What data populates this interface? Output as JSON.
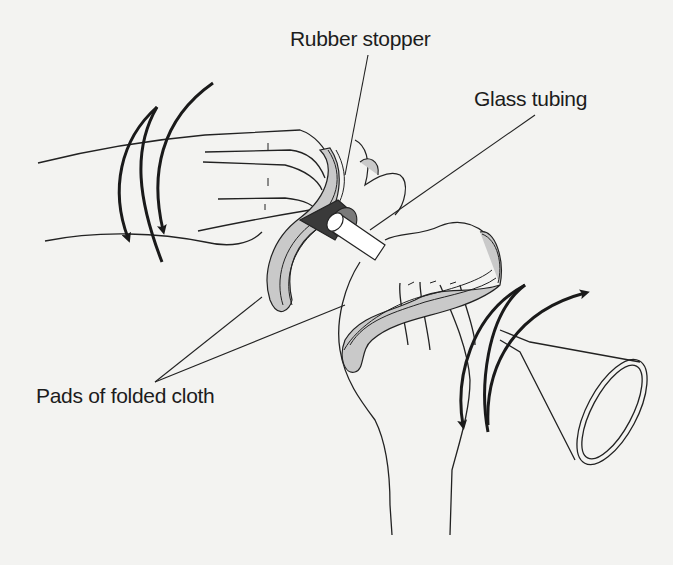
{
  "figure": {
    "type": "illustration",
    "labels": {
      "rubber_stopper": "Rubber stopper",
      "glass_tubing": "Glass tubing",
      "pads": "Pads of folded cloth"
    },
    "icons": [
      "rotation-arrows-left-hand",
      "rotation-arrows-right-hand"
    ],
    "colors": {
      "background": "#f3f3f1",
      "line": "#222222",
      "stopper_fill": "#3a3a3a",
      "stopper_rim": "#7a7a7a",
      "cloth_inner": "#c9c9c9",
      "arrow": "#1a1a1a"
    }
  }
}
